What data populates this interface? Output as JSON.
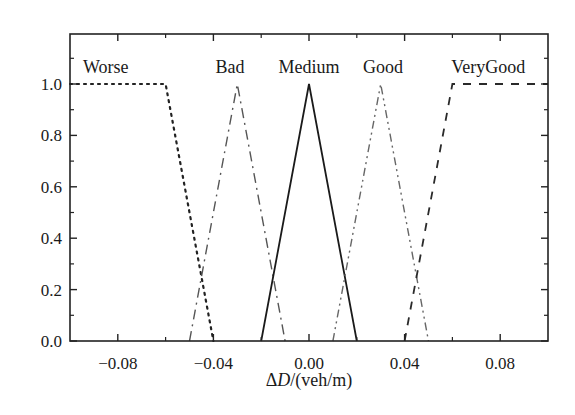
{
  "chart_data": {
    "type": "line",
    "title": "",
    "xlabel": "ΔD/(veh/m)",
    "xlabel_parts": {
      "delta": "Δ",
      "var": "D",
      "unit": "/(veh/m)"
    },
    "ylabel": "",
    "xlim": [
      -0.1,
      0.1
    ],
    "ylim": [
      0.0,
      1.2
    ],
    "x_ticks": [
      -0.08,
      -0.04,
      0.0,
      0.04,
      0.08
    ],
    "x_tick_labels": [
      "−0.08",
      "−0.04",
      "0.00",
      "0.04",
      "0.08"
    ],
    "x_minor_ticks": [
      -0.06,
      -0.02,
      0.02,
      0.06
    ],
    "y_ticks": [
      0.0,
      0.2,
      0.4,
      0.6,
      0.8,
      1.0
    ],
    "y_tick_labels": [
      "0.0",
      "0.2",
      "0.4",
      "0.6",
      "0.8",
      "1.0"
    ],
    "y_minor_ticks": [
      0.1,
      0.3,
      0.5,
      0.7,
      0.9,
      1.1
    ],
    "grid": false,
    "legend": "inline labels above curves",
    "series": [
      {
        "name": "Worse",
        "style": "dotted",
        "x": [
          -0.1,
          -0.06,
          -0.04
        ],
        "y": [
          1.0,
          1.0,
          0.0
        ],
        "label_x": -0.085
      },
      {
        "name": "Bad",
        "style": "dash-dot",
        "x": [
          -0.05,
          -0.03,
          -0.01
        ],
        "y": [
          0.0,
          1.0,
          0.0
        ],
        "label_x": -0.033
      },
      {
        "name": "Medium",
        "style": "solid",
        "x": [
          -0.02,
          0.0,
          0.02
        ],
        "y": [
          0.0,
          1.0,
          0.0
        ],
        "label_x": 0.0
      },
      {
        "name": "Good",
        "style": "dash-dot-dot",
        "x": [
          0.01,
          0.03,
          0.05
        ],
        "y": [
          0.0,
          1.0,
          0.0
        ],
        "label_x": 0.031
      },
      {
        "name": "VeryGood",
        "style": "dashed",
        "x": [
          0.04,
          0.06,
          0.1
        ],
        "y": [
          0.0,
          1.0,
          1.0
        ],
        "label_x": 0.075
      }
    ]
  }
}
